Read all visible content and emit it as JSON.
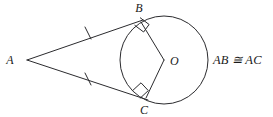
{
  "figure": {
    "background_color": "#ffffff",
    "stroke_color": "#2b2b2e",
    "label_color": "#1a1a1a",
    "width": 273,
    "height": 117
  },
  "labels": {
    "vertex_a": "A",
    "vertex_b": "B",
    "vertex_c": "C",
    "center_o": "O",
    "congruence": "AB ≅ AC"
  },
  "geometry": {
    "external_point": {
      "label": "A",
      "x": 27,
      "y": 60
    },
    "tangent_point_b": {
      "label": "B",
      "x": 141,
      "y": 22
    },
    "tangent_point_c": {
      "label": "C",
      "x": 146,
      "y": 98
    },
    "circle_center": {
      "label": "O",
      "x": 164,
      "y": 60
    },
    "circle_radius": 44,
    "segments": [
      {
        "name": "AB",
        "from": "A",
        "to": "B",
        "tick_marks": 1
      },
      {
        "name": "AC",
        "from": "A",
        "to": "C",
        "tick_marks": 1
      },
      {
        "name": "OB",
        "from": "O",
        "to": "B",
        "tick_marks": 0
      },
      {
        "name": "OC",
        "from": "O",
        "to": "C",
        "tick_marks": 0
      }
    ],
    "right_angles": [
      {
        "at": "B",
        "between": [
          "AB",
          "OB"
        ]
      },
      {
        "at": "C",
        "between": [
          "AC",
          "OC"
        ]
      }
    ]
  },
  "label_positions": {
    "a": {
      "x": 10,
      "y": 64
    },
    "b": {
      "x": 137,
      "y": 12
    },
    "c": {
      "x": 141,
      "y": 114
    },
    "o": {
      "x": 170,
      "y": 65
    },
    "congruence": {
      "x": 213,
      "y": 64
    }
  }
}
